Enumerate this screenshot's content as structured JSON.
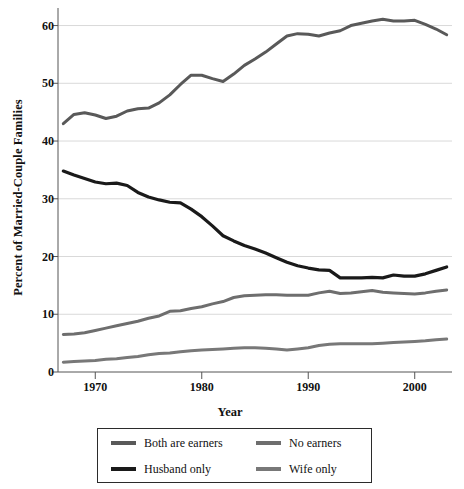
{
  "chart_data": {
    "type": "line",
    "title": "",
    "xlabel": "Year",
    "ylabel": "Percent of Married-Couple Families",
    "xlim": [
      1966.5,
      2003.5
    ],
    "ylim": [
      0,
      62
    ],
    "xticks": [
      1970,
      1980,
      1990,
      2000
    ],
    "yticks": [
      0,
      10,
      20,
      30,
      40,
      50,
      60
    ],
    "grid": "horizontal",
    "legend_position": "below-center",
    "x": [
      1967,
      1968,
      1969,
      1970,
      1971,
      1972,
      1973,
      1974,
      1975,
      1976,
      1977,
      1978,
      1979,
      1980,
      1981,
      1982,
      1983,
      1984,
      1985,
      1986,
      1987,
      1988,
      1989,
      1990,
      1991,
      1992,
      1993,
      1994,
      1995,
      1996,
      1997,
      1998,
      1999,
      2000,
      2001,
      2002,
      2003
    ],
    "series": [
      {
        "name": "Both are earners",
        "color": "#595959",
        "width": 3.0,
        "values": [
          43.0,
          44.6,
          44.9,
          44.5,
          43.9,
          44.3,
          45.2,
          45.6,
          45.7,
          46.6,
          48.0,
          49.8,
          51.4,
          51.4,
          50.8,
          50.3,
          51.6,
          53.1,
          54.2,
          55.4,
          56.8,
          58.2,
          58.6,
          58.5,
          58.2,
          58.7,
          59.1,
          60.0,
          60.4,
          60.8,
          61.1,
          60.8,
          60.8,
          60.9,
          60.2,
          59.4,
          58.4
        ]
      },
      {
        "name": "Husband only",
        "color": "#1a1a1a",
        "width": 3.2,
        "values": [
          34.8,
          34.1,
          33.5,
          32.9,
          32.6,
          32.7,
          32.3,
          31.1,
          30.3,
          29.8,
          29.4,
          29.3,
          28.2,
          26.9,
          25.3,
          23.6,
          22.7,
          21.9,
          21.3,
          20.6,
          19.8,
          19.0,
          18.4,
          18.0,
          17.7,
          17.6,
          16.3,
          16.3,
          16.3,
          16.4,
          16.3,
          16.8,
          16.6,
          16.6,
          17.0,
          17.6,
          18.2
        ]
      },
      {
        "name": "No earners",
        "color": "#6e6e6e",
        "width": 3.0,
        "values": [
          6.5,
          6.6,
          6.8,
          7.2,
          7.6,
          8.0,
          8.4,
          8.8,
          9.3,
          9.7,
          10.5,
          10.6,
          11.0,
          11.3,
          11.8,
          12.2,
          12.9,
          13.2,
          13.3,
          13.4,
          13.4,
          13.3,
          13.3,
          13.3,
          13.7,
          14.0,
          13.6,
          13.7,
          13.9,
          14.1,
          13.8,
          13.7,
          13.6,
          13.5,
          13.7,
          14.0,
          14.2
        ]
      },
      {
        "name": "Wife only",
        "color": "#787878",
        "width": 3.0,
        "values": [
          1.7,
          1.8,
          1.9,
          2.0,
          2.2,
          2.3,
          2.5,
          2.7,
          3.0,
          3.2,
          3.3,
          3.5,
          3.7,
          3.8,
          3.9,
          4.0,
          4.1,
          4.2,
          4.2,
          4.1,
          4.0,
          3.8,
          4.0,
          4.2,
          4.6,
          4.8,
          4.9,
          4.9,
          4.9,
          4.9,
          5.0,
          5.1,
          5.2,
          5.3,
          5.4,
          5.6,
          5.7
        ]
      }
    ]
  },
  "axes": {
    "ylabel": "Percent of Married-Couple Families",
    "xlabel": "Year",
    "yticklabels": [
      "0",
      "10",
      "20",
      "30",
      "40",
      "50",
      "60"
    ],
    "xticklabels": [
      "1970",
      "1980",
      "1990",
      "2000"
    ]
  },
  "legend": {
    "items": [
      {
        "label": "Both are earners",
        "color": "#595959"
      },
      {
        "label": "No earners",
        "color": "#6e6e6e"
      },
      {
        "label": "Husband only",
        "color": "#1a1a1a"
      },
      {
        "label": "Wife only",
        "color": "#787878"
      }
    ]
  },
  "style": {
    "grid_color": "#d9d9d9",
    "axis_color": "#555555",
    "background": "#ffffff"
  }
}
